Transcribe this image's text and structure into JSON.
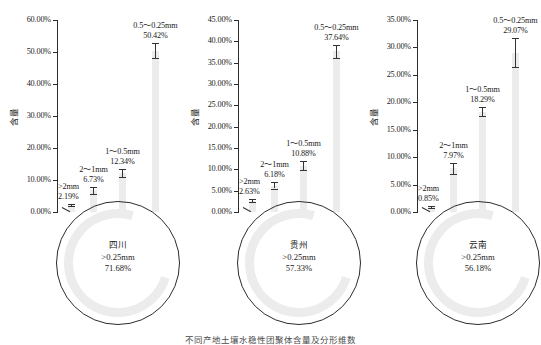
{
  "figure": {
    "yaxis_title": "含量",
    "caption": "不同产地土壤水稳性团聚体含量及分形维数"
  },
  "chart_data": {
    "type": "bar",
    "title": "不同产地土壤水稳性团聚体含量及分形维数",
    "xlabel": "",
    "ylabel": "含量",
    "categories": [
      ">2mm",
      "2～1mm",
      "1～0.5mm",
      "0.5～0.25mm"
    ],
    "panels": [
      {
        "name": "四川",
        "region_label": "四川",
        "donut_size_label": ">0.25mm",
        "donut_value_label": "71.68%",
        "donut_value": 71.68,
        "ylim": [
          0,
          60
        ],
        "ytick_step": 5,
        "yticks": [
          0,
          10,
          20,
          30,
          40,
          50,
          60
        ],
        "ytick_labels": [
          "0.00%",
          "10.00%",
          "20.00%",
          "30.00%",
          "40.00%",
          "50.00%",
          "60.00%"
        ],
        "values": [
          2.19,
          6.73,
          12.34,
          50.42
        ],
        "value_labels": [
          "2.19%",
          "6.73%",
          "12.34%",
          "50.42%"
        ],
        "errors": [
          0.45,
          1.05,
          1.25,
          2.3
        ]
      },
      {
        "name": "贵州",
        "region_label": "贵州",
        "donut_size_label": ">0.25mm",
        "donut_value_label": "57.33%",
        "donut_value": 57.33,
        "ylim": [
          0,
          45
        ],
        "ytick_step": 5,
        "yticks": [
          0,
          5,
          10,
          15,
          20,
          25,
          30,
          35,
          40,
          45
        ],
        "ytick_labels": [
          "0.00%",
          "5.00%",
          "10.00%",
          "15.00%",
          "20.00%",
          "25.00%",
          "30.00%",
          "35.00%",
          "40.00%",
          "45.00%"
        ],
        "values": [
          2.63,
          6.18,
          10.88,
          37.64
        ],
        "value_labels": [
          "2.63%",
          "6.18%",
          "10.88%",
          "37.64%"
        ],
        "errors": [
          0.3,
          0.75,
          1.1,
          1.6
        ]
      },
      {
        "name": "云南",
        "region_label": "云南",
        "donut_size_label": ">0.25mm",
        "donut_value_label": "56.18%",
        "donut_value": 56.18,
        "ylim": [
          0,
          35
        ],
        "ytick_step": 5,
        "yticks": [
          0,
          5,
          10,
          15,
          20,
          25,
          30,
          35
        ],
        "ytick_labels": [
          "0.00%",
          "5.00%",
          "10.00%",
          "15.00%",
          "20.00%",
          "25.00%",
          "30.00%",
          "35.00%"
        ],
        "values": [
          0.85,
          7.97,
          18.29,
          29.07
        ],
        "value_labels": [
          "0.85%",
          "7.97%",
          "18.29%",
          "29.07%"
        ],
        "errors": [
          0.2,
          1.0,
          0.85,
          2.6
        ]
      }
    ],
    "colors": {
      "bar": "#ececec",
      "error": "#333333",
      "axis": "#2b2b2b",
      "text": "#1a1a1a"
    },
    "grid": false,
    "legend": "none"
  }
}
